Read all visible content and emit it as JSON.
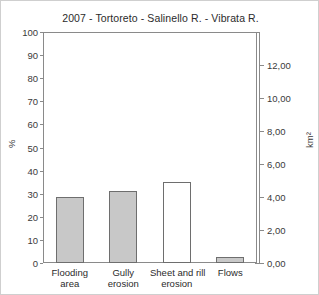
{
  "chart_data": {
    "type": "bar",
    "title": "2007 - Tortoreto - Salinello R. - Vibrata R.",
    "xlabel": "",
    "ylabel": "%",
    "ylabel_secondary": "km2",
    "ylabel_secondary_display": "km²",
    "categories": [
      "Flooding area",
      "Gully erosion",
      "Sheet and rill erosion",
      "Flows"
    ],
    "category_lines": [
      [
        "Flooding",
        "area"
      ],
      [
        "Gully",
        "erosion"
      ],
      [
        "Sheet and rill",
        "erosion"
      ],
      [
        "Flows"
      ]
    ],
    "values": [
      28.5,
      31,
      35,
      2.5
    ],
    "bar_styles": [
      "filled",
      "filled",
      "hollow",
      "filled"
    ],
    "ylim": [
      0,
      100
    ],
    "ytick_step": 10,
    "yticks": [
      "0",
      "10",
      "20",
      "30",
      "40",
      "50",
      "60",
      "70",
      "80",
      "90",
      "100"
    ],
    "ylim_secondary": [
      0,
      14
    ],
    "ytick_secondary_step": 2,
    "yticks_secondary": [
      "0,00",
      "2,00",
      "4,00",
      "6,00",
      "8,00",
      "10,00",
      "12,00"
    ],
    "grid": false,
    "legend": "none",
    "colors": {
      "bar_fill": "#c8c8c8",
      "bar_edge": "#6e6e6e",
      "axis": "#8a8a8a",
      "text": "#2b2b2b",
      "frame": "#cfcfcf"
    }
  }
}
